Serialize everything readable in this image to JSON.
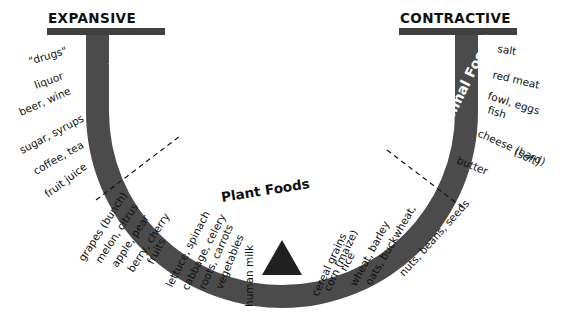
{
  "headers": {
    "left": "EXPANSIVE",
    "right": "CONTRACTIVE"
  },
  "band_labels": {
    "left": "Derivatives",
    "center": "Plant Foods",
    "right": "Animal Foods"
  },
  "fulcrum": {
    "label": "human milk"
  },
  "colors": {
    "band": "#4b4b4b",
    "header_bar": "#3f3f3f",
    "text": "#111111",
    "band_text": "#ffffff",
    "background": "#ffffff",
    "dashed": "#111111"
  },
  "left_outer_items": [
    {
      "label": "\"drugs\""
    },
    {
      "label": "liquor"
    },
    {
      "label": "beer, wine"
    },
    {
      "label": "sugar, syrups"
    },
    {
      "label": "coffee, tea"
    },
    {
      "label": "fruit juice"
    }
  ],
  "left_lower_items": [
    {
      "label": "grapes (bunch)"
    },
    {
      "label": "melon, citrus"
    },
    {
      "label": "apple, pear"
    },
    {
      "label": "berry, cherry"
    },
    {
      "label": "fruits"
    }
  ],
  "bottom_left_items": [
    {
      "label": "lettuce, spinach"
    },
    {
      "label": "cabbage, celery"
    },
    {
      "label": "roots, carrots"
    },
    {
      "label": "vegetables"
    }
  ],
  "bottom_right_items": [
    {
      "label": "cereal grains"
    },
    {
      "label": "corn (maize)"
    },
    {
      "label": "rice"
    },
    {
      "label": "wheat, barley"
    },
    {
      "label": "oats, buckwheat,"
    },
    {
      "label": "nuts, beans, seeds"
    }
  ],
  "right_outer_items": [
    {
      "label": "salt"
    },
    {
      "label": "red meat"
    },
    {
      "label": "fowl, eggs"
    },
    {
      "label": "fish"
    },
    {
      "label": "cheese (hard)"
    },
    {
      "label": "(soft)"
    },
    {
      "label": "butter"
    }
  ]
}
